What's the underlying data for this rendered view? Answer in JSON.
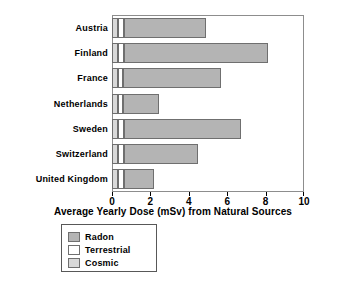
{
  "chart_data": {
    "type": "bar",
    "orientation": "horizontal",
    "stacked": true,
    "title": "",
    "xlabel": "Average Yearly Dose (mSv) from Natural Sources",
    "ylabel": "",
    "xlim": [
      0,
      10
    ],
    "xticks": [
      0,
      2,
      4,
      6,
      8,
      10
    ],
    "xtick_labels": [
      "0",
      "2",
      "4",
      "6",
      "8",
      "10"
    ],
    "grid": false,
    "legend_position": "below-left",
    "categories": [
      "Austria",
      "Finland",
      "France",
      "Netherlands",
      "Sweden",
      "Switzerland",
      "United Kingdom"
    ],
    "series": [
      {
        "name": "Cosmic",
        "color": "#d9d9d9",
        "values": [
          0.3,
          0.3,
          0.3,
          0.3,
          0.3,
          0.3,
          0.3
        ]
      },
      {
        "name": "Terrestrial",
        "color": "#ffffff",
        "values": [
          0.3,
          0.3,
          0.25,
          0.25,
          0.35,
          0.3,
          0.3
        ]
      },
      {
        "name": "Radon",
        "color": "#b4b4b4",
        "values": [
          4.3,
          7.5,
          5.15,
          1.9,
          6.05,
          3.9,
          1.6
        ]
      }
    ],
    "totals": [
      4.9,
      8.1,
      5.7,
      2.45,
      6.7,
      4.5,
      2.2
    ]
  },
  "legend": {
    "entries": [
      {
        "label": "Radon",
        "color": "#b4b4b4"
      },
      {
        "label": "Terrestrial",
        "color": "#ffffff"
      },
      {
        "label": "Cosmic",
        "color": "#d9d9d9"
      }
    ]
  },
  "axis": {
    "title": "Average Yearly Dose (mSv) from Natural Sources"
  }
}
